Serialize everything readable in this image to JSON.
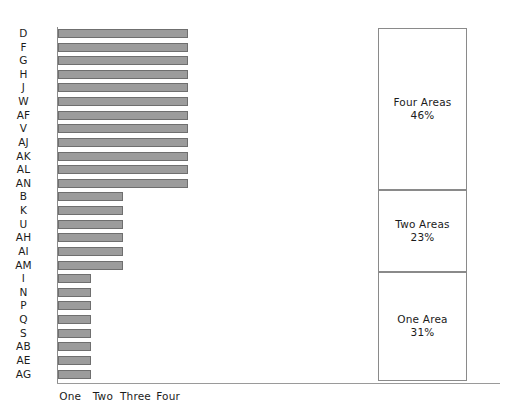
{
  "chart_data": [
    {
      "type": "bar",
      "orientation": "horizontal",
      "title": "",
      "xlabel": "",
      "ylabel": "",
      "categories": [
        "D",
        "F",
        "G",
        "H",
        "J",
        "W",
        "AF",
        "V",
        "AJ",
        "AK",
        "AL",
        "AN",
        "B",
        "K",
        "U",
        "AH",
        "AI",
        "AM",
        "I",
        "N",
        "P",
        "Q",
        "S",
        "AB",
        "AE",
        "AG"
      ],
      "values": [
        4,
        4,
        4,
        4,
        4,
        4,
        4,
        4,
        4,
        4,
        4,
        4,
        2,
        2,
        2,
        2,
        2,
        2,
        1,
        1,
        1,
        1,
        1,
        1,
        1,
        1
      ],
      "xtick_labels": [
        "One",
        "Two",
        "Three",
        "Four"
      ],
      "xtick_values": [
        1,
        2,
        3,
        4
      ],
      "xlim": [
        0,
        4.4
      ],
      "grid": false,
      "legend": "none",
      "bar_fill": "#9c9c9c",
      "bar_stroke": "#6f6f6f"
    },
    {
      "type": "bar",
      "subtype": "stacked-column",
      "title": "",
      "categories": [
        "Four Areas",
        "Two Areas",
        "One Area"
      ],
      "values": [
        46,
        23,
        31
      ],
      "value_labels": [
        "46%",
        "23%",
        "31%"
      ],
      "unit": "%",
      "ylim": [
        0,
        100
      ],
      "grid": false,
      "legend": "none",
      "segment_fill": "#ffffff",
      "segment_stroke": "#8a8a8a"
    }
  ],
  "bar_chart": {
    "rows": [
      {
        "label": "D",
        "value": 4
      },
      {
        "label": "F",
        "value": 4
      },
      {
        "label": "G",
        "value": 4
      },
      {
        "label": "H",
        "value": 4
      },
      {
        "label": "J",
        "value": 4
      },
      {
        "label": "W",
        "value": 4
      },
      {
        "label": "AF",
        "value": 4
      },
      {
        "label": "V",
        "value": 4
      },
      {
        "label": "AJ",
        "value": 4
      },
      {
        "label": "AK",
        "value": 4
      },
      {
        "label": "AL",
        "value": 4
      },
      {
        "label": "AN",
        "value": 4
      },
      {
        "label": "B",
        "value": 2
      },
      {
        "label": "K",
        "value": 2
      },
      {
        "label": "U",
        "value": 2
      },
      {
        "label": "AH",
        "value": 2
      },
      {
        "label": "AI",
        "value": 2
      },
      {
        "label": "AM",
        "value": 2
      },
      {
        "label": "I",
        "value": 1
      },
      {
        "label": "N",
        "value": 1
      },
      {
        "label": "P",
        "value": 1
      },
      {
        "label": "Q",
        "value": 1
      },
      {
        "label": "S",
        "value": 1
      },
      {
        "label": "AB",
        "value": 1
      },
      {
        "label": "AE",
        "value": 1
      },
      {
        "label": "AG",
        "value": 1
      }
    ],
    "x_ticks": [
      {
        "label": "One",
        "value": 1
      },
      {
        "label": "Two",
        "value": 2
      },
      {
        "label": "Three",
        "value": 3
      },
      {
        "label": "Four",
        "value": 4
      }
    ]
  },
  "stack_chart": {
    "segments": [
      {
        "label": "Four Areas",
        "value": "46%",
        "pct": 46
      },
      {
        "label": "Two Areas",
        "value": "23%",
        "pct": 23
      },
      {
        "label": "One Area",
        "value": "31%",
        "pct": 31
      }
    ]
  },
  "colors": {
    "bar_fill": "#9c9c9c",
    "bar_stroke": "#6f6f6f",
    "axis": "#8c8c8c",
    "text": "#1b1b1b",
    "segment_stroke": "#8a8a8a"
  }
}
